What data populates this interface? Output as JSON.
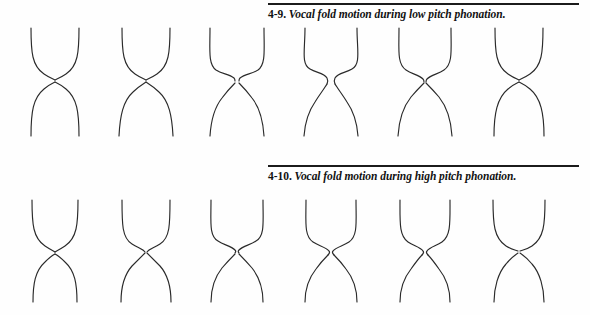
{
  "page": {
    "background_color": "#fefefe",
    "line_color": "#2a2a2a",
    "rule_color": "#1b1b1b"
  },
  "figures": [
    {
      "id": "4-9",
      "number_label": "4-9.",
      "caption": "Vocal fold motion during low pitch phonation.",
      "row_name": "low-pitch-row",
      "frame_count": 6,
      "frames": [
        {
          "index": 1,
          "state": "closed",
          "glottal_gap_px": 0
        },
        {
          "index": 2,
          "state": "closed",
          "glottal_gap_px": 0
        },
        {
          "index": 3,
          "state": "opening",
          "glottal_gap_px": 4
        },
        {
          "index": 4,
          "state": "maximum-open",
          "glottal_gap_px": 9
        },
        {
          "index": 5,
          "state": "closing",
          "glottal_gap_px": 4
        },
        {
          "index": 6,
          "state": "closed",
          "glottal_gap_px": 0
        }
      ]
    },
    {
      "id": "4-10",
      "number_label": "4-10.",
      "caption": "Vocal fold motion during high pitch phonation.",
      "row_name": "high-pitch-row",
      "frame_count": 6,
      "frames": [
        {
          "index": 1,
          "state": "closed",
          "glottal_gap_px": 0
        },
        {
          "index": 2,
          "state": "opening",
          "glottal_gap_px": 3
        },
        {
          "index": 3,
          "state": "opening",
          "glottal_gap_px": 5
        },
        {
          "index": 4,
          "state": "maximum-open",
          "glottal_gap_px": 6
        },
        {
          "index": 5,
          "state": "closing",
          "glottal_gap_px": 5
        },
        {
          "index": 6,
          "state": "closed",
          "glottal_gap_px": 1
        }
      ]
    }
  ]
}
